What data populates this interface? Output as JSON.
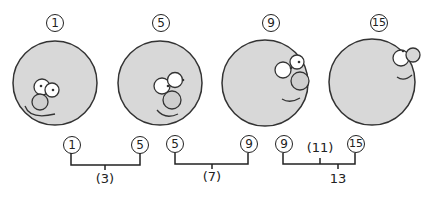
{
  "frames": [
    {
      "label": "1",
      "cx": 55,
      "cy": 83
    },
    {
      "label": "5",
      "cx": 160,
      "cy": 83
    },
    {
      "label": "9",
      "cx": 270,
      "cy": 83
    },
    {
      "label": "15",
      "cx": 378,
      "cy": 80
    }
  ],
  "brackets": [
    {
      "left": "1",
      "right": "5",
      "middle": "(3)"
    },
    {
      "left": "5",
      "right": "9",
      "middle": "(7)"
    },
    {
      "left": "9",
      "right": "15",
      "top_middle": "(11)",
      "middle": "13"
    }
  ],
  "colors": {
    "disc": "#d9d9d9",
    "ink": "#222222"
  }
}
